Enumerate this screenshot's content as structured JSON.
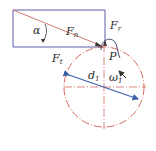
{
  "diagram": {
    "labels": {
      "normal_force": "F",
      "normal_force_sub": "n",
      "radial_force": "F",
      "radial_force_sub": "r",
      "tangential_force": "F",
      "tangential_force_sub": "t",
      "pressure_angle": "α",
      "pitch_point": "P",
      "pitch_diameter": "d",
      "pitch_diameter_sub": "1",
      "angular_velocity": "ω",
      "angular_velocity_sub": "1"
    },
    "colors": {
      "force_lines": "#5a5ea8",
      "normal_force_line": "#d07a70",
      "pitch_circle": "#d0584a",
      "center_lines": "#d0584a",
      "diameter_line": "#3b5fa8",
      "text": "#2a2a2a"
    }
  }
}
